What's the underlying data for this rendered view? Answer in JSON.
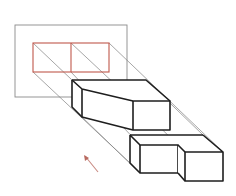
{
  "diagram": {
    "title": "Oblique parallel projection of stepped blocks onto a plane",
    "projection_plane": {
      "label": "projection plane",
      "rect": {
        "x": 15,
        "y": 25,
        "w": 112,
        "h": 72
      },
      "stroke": "#8a8a8a"
    },
    "projected_outline": {
      "label": "projected outline (two cells)",
      "rect": {
        "x": 33,
        "y": 43,
        "w": 76,
        "h": 29
      },
      "divider_x": 71,
      "stroke": "#c0584c"
    },
    "solids": [
      {
        "name": "upper-tapered-block",
        "label": "tapered block"
      },
      {
        "name": "lower-left-cube",
        "label": "cube"
      },
      {
        "name": "lower-right-cube",
        "label": "cube"
      }
    ],
    "projection_direction": {
      "label": "projection direction arrow",
      "from": [
        98,
        172
      ],
      "to": [
        84,
        155
      ],
      "color": "#c88a82"
    },
    "colors": {
      "solid_edges": "#1e1e1e",
      "projector_lines": "#7f7f7f",
      "outline": "#c0584c",
      "background": "#ffffff"
    }
  }
}
